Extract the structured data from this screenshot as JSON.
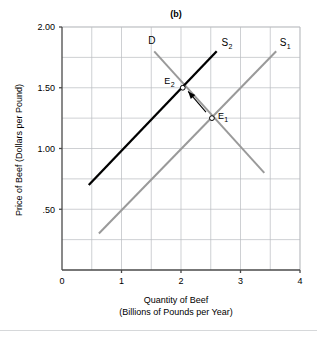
{
  "chart_data": {
    "type": "line",
    "title": "(b)",
    "xlabel": "Quantity of Beef",
    "xlabel_sub": "(Billions of Pounds per Year)",
    "ylabel": "Price of Beef (Dollars per Pound)",
    "xlim": [
      0,
      4
    ],
    "ylim": [
      0,
      2.0
    ],
    "xticks": [
      0,
      1,
      2,
      3,
      4
    ],
    "xtick_labels": [
      "0",
      "1",
      "2",
      "3",
      "4"
    ],
    "yticks": [
      0.5,
      1.0,
      1.5,
      2.0
    ],
    "ytick_labels": [
      ".50",
      "1.00",
      "1.50",
      "2.00"
    ],
    "grid": true,
    "grid_x_minor": [
      0.5,
      1.5,
      2.5,
      3.5
    ],
    "grid_y_minor": [
      0.25,
      0.75,
      1.25,
      1.75
    ],
    "legend_position": "inline-labels",
    "colors": {
      "demand": "#9a9a9a",
      "supply_1": "#9a9a9a",
      "supply_2": "#000000",
      "grid": "#b9bcc0",
      "axis": "#4a4a4a",
      "arrow": "#000000"
    },
    "series": [
      {
        "name": "D",
        "label": "D",
        "sublabel": "",
        "color": "#9a9a9a",
        "x": [
          1.55,
          3.4
        ],
        "y": [
          1.8,
          0.8
        ],
        "label_pos": {
          "x": 1.45,
          "y": 1.86
        }
      },
      {
        "name": "S2",
        "label": "S",
        "sublabel": "2",
        "color": "#000000",
        "x": [
          0.45,
          2.6
        ],
        "y": [
          0.7,
          1.8
        ],
        "label_pos": {
          "x": 2.68,
          "y": 1.84
        }
      },
      {
        "name": "S1",
        "label": "S",
        "sublabel": "1",
        "color": "#9a9a9a",
        "x": [
          0.62,
          3.6
        ],
        "y": [
          0.3,
          1.8
        ],
        "label_pos": {
          "x": 3.66,
          "y": 1.84
        }
      }
    ],
    "points": [
      {
        "name": "E2",
        "label": "E",
        "sublabel": "2",
        "x": 2.03,
        "y": 1.5,
        "label_pos": {
          "x": 1.72,
          "y": 1.53
        }
      },
      {
        "name": "E1",
        "label": "E",
        "sublabel": "1",
        "x": 2.52,
        "y": 1.25,
        "label_pos": {
          "x": 2.62,
          "y": 1.24
        }
      }
    ],
    "annotations": [
      {
        "name": "shift-arrow",
        "type": "arrow",
        "from": {
          "x": 2.42,
          "y": 1.3
        },
        "to": {
          "x": 2.12,
          "y": 1.47
        }
      }
    ]
  }
}
